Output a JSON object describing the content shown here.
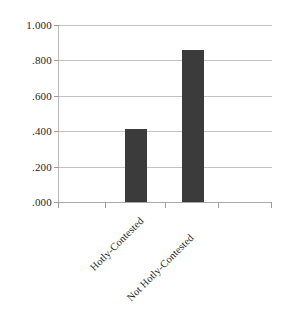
{
  "chart_data": {
    "type": "bar",
    "title": "",
    "subtitle": "",
    "xlabel": "",
    "ylabel": "",
    "categories": [
      "Hotly-Contested",
      "Not Hotly-Contested"
    ],
    "values": [
      0.41,
      0.86
    ],
    "ylim": [
      0.0,
      1.0
    ],
    "ytick_values": [
      1.0,
      0.8,
      0.6,
      0.4,
      0.2,
      0.0
    ],
    "ytick_labels": [
      "1.000",
      ".800",
      ".600",
      ".400",
      ".200",
      ".000"
    ],
    "grid": true,
    "grid_axis": "y",
    "legend": false,
    "legend_position": "none",
    "bar_color": "#3b3b3b",
    "gridline_color": "#c3c3c3",
    "axis_color": "#a8a8a8",
    "background_color": "#ffffff",
    "label_rotation_degrees": -45
  }
}
